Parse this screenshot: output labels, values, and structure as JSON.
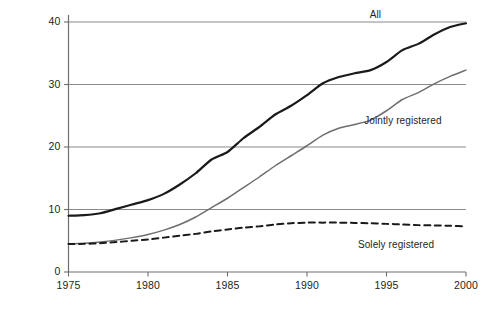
{
  "chart_data": {
    "type": "line",
    "title": "",
    "subtitle": "",
    "xlabel": "",
    "ylabel": "",
    "xlim": [
      1975,
      2000
    ],
    "ylim": [
      0,
      40
    ],
    "grid": true,
    "grid_axis": "y",
    "legend_position": "inline-annotations",
    "xticks": [
      "1975",
      "1980",
      "1985",
      "1990",
      "1995",
      "2000"
    ],
    "xtick_values": [
      1975,
      1980,
      1985,
      1990,
      1995,
      2000
    ],
    "yticks": [
      "0",
      "10",
      "20",
      "30",
      "40"
    ],
    "ytick_values": [
      0,
      10,
      20,
      30,
      40
    ],
    "x": [
      1975,
      1976,
      1977,
      1978,
      1979,
      1980,
      1981,
      1982,
      1983,
      1984,
      1985,
      1986,
      1987,
      1988,
      1989,
      1990,
      1991,
      1992,
      1993,
      1994,
      1995,
      1996,
      1997,
      1998,
      1999,
      2000
    ],
    "series": [
      {
        "name": "All",
        "color": "#1a1a1a",
        "style": "solid",
        "width": 2.2,
        "label_x": 1994.2,
        "label_y": 41.2,
        "values": [
          9.0,
          9.1,
          9.4,
          10.1,
          10.8,
          11.5,
          12.5,
          14.0,
          15.8,
          18.0,
          19.2,
          21.4,
          23.2,
          25.2,
          26.6,
          28.3,
          30.2,
          31.2,
          31.8,
          32.3,
          33.6,
          35.5,
          36.5,
          38.0,
          39.2,
          39.8
        ]
      },
      {
        "name": "Jointly registered",
        "color": "#6d6e71",
        "style": "solid",
        "width": 1.5,
        "label_x": 1993.6,
        "label_y": 24.2,
        "values": [
          4.5,
          4.6,
          4.8,
          5.1,
          5.5,
          6.0,
          6.7,
          7.6,
          8.8,
          10.3,
          11.8,
          13.5,
          15.2,
          17.0,
          18.6,
          20.2,
          21.9,
          23.0,
          23.6,
          24.3,
          25.8,
          27.6,
          28.7,
          30.1,
          31.3,
          32.3
        ]
      },
      {
        "name": "Solely registered",
        "color": "#1a1a1a",
        "style": "dashed",
        "width": 2.0,
        "label_x": 1993.2,
        "label_y": 4.3,
        "values": [
          4.5,
          4.5,
          4.6,
          4.8,
          5.0,
          5.2,
          5.5,
          5.8,
          6.1,
          6.5,
          6.8,
          7.1,
          7.3,
          7.6,
          7.8,
          7.9,
          7.9,
          7.9,
          7.85,
          7.8,
          7.7,
          7.6,
          7.5,
          7.45,
          7.4,
          7.3
        ]
      }
    ]
  },
  "axes": {
    "axis_color": "#6d6e71",
    "grid_color": "#8a8a8d",
    "tick_color": "#231f20"
  }
}
